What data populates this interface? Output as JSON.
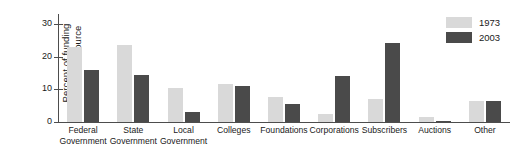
{
  "chart_data": {
    "type": "bar",
    "title": "",
    "subtitle": "",
    "xlabel": "",
    "ylabel": "Percent of funding from each source",
    "ylabel_lines": [
      "Percent of funding",
      "from each source"
    ],
    "ylim": [
      0,
      33
    ],
    "yticks": [
      0,
      10,
      20,
      30
    ],
    "ytick_labels": [
      "0",
      "10",
      "20",
      "30"
    ],
    "grid": false,
    "legend_position": "top-right",
    "categories": [
      "Federal Government",
      "State Government",
      "Local Government",
      "Colleges",
      "Foundations",
      "Corporations",
      "Subscribers",
      "Auctions",
      "Other"
    ],
    "category_lines": [
      [
        "Federal",
        "Government"
      ],
      [
        "State",
        "Government"
      ],
      [
        "Local",
        "Government"
      ],
      [
        "Colleges",
        ""
      ],
      [
        "Foundations",
        ""
      ],
      [
        "Corporations",
        ""
      ],
      [
        "Subscribers",
        ""
      ],
      [
        "Auctions",
        ""
      ],
      [
        "Other",
        ""
      ]
    ],
    "series": [
      {
        "name": "1973",
        "color": "#d9d9d9",
        "values": [
          23,
          23.5,
          10.5,
          11.5,
          7.5,
          2.5,
          7,
          1.5,
          6.5
        ]
      },
      {
        "name": "2003",
        "color": "#4a4a4a",
        "values": [
          16,
          14.5,
          3,
          11,
          5.5,
          14,
          24,
          0.3,
          6.5
        ]
      }
    ]
  },
  "legend": {
    "items": [
      {
        "label": "1973",
        "color": "#d9d9d9"
      },
      {
        "label": "2003",
        "color": "#4a4a4a"
      }
    ]
  }
}
